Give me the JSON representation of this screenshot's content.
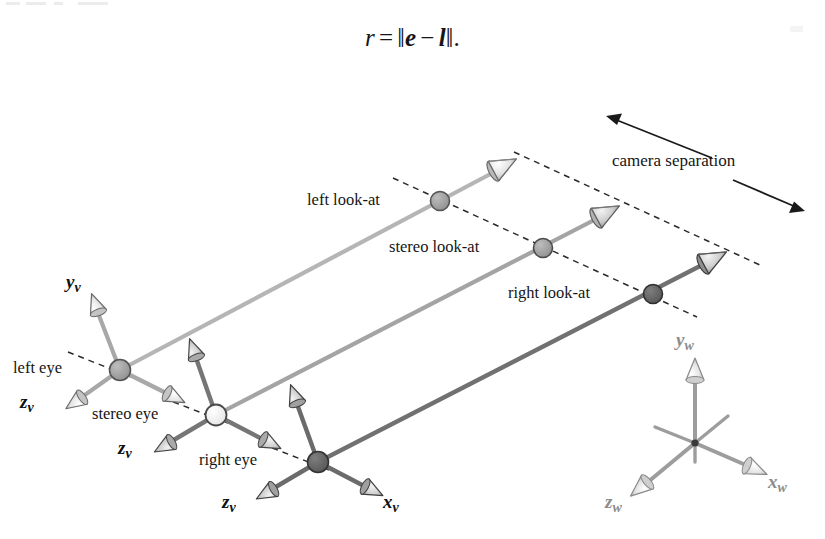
{
  "figure": {
    "equation": {
      "lhs": "r",
      "equals": "=",
      "norm_open": "‖",
      "vec_e": "e",
      "minus": "−",
      "vec_l": "l",
      "norm_close": "‖",
      "period": "."
    },
    "labels": {
      "left_eye": "left eye",
      "stereo_eye": "stereo eye",
      "right_eye": "right eye",
      "left_lookat": "left look-at",
      "stereo_lookat": "stereo look-at",
      "right_lookat": "right look-at",
      "camera_separation": "camera separation"
    },
    "axes": {
      "left_eye_y": {
        "name": "y",
        "sub": "v"
      },
      "left_eye_z": {
        "name": "z",
        "sub": "v"
      },
      "stereo_eye_z": {
        "name": "z",
        "sub": "v"
      },
      "right_eye_z": {
        "name": "z",
        "sub": "v"
      },
      "right_eye_x": {
        "name": "x",
        "sub": "v"
      },
      "world_y": {
        "name": "y",
        "sub": "w"
      },
      "world_x": {
        "name": "x",
        "sub": "w"
      },
      "world_z": {
        "name": "z",
        "sub": "w"
      }
    },
    "colors": {
      "left_ray": "#b3b3b3",
      "stereo_ray": "#9a9a9a",
      "right_ray": "#6e6e6e",
      "left_node": "#9b9b9b",
      "stereo_node": "#f2f2f2",
      "right_node": "#5f5f5f",
      "world_axis": "#9a9a9a",
      "dashed": "#2b2b2b",
      "text": "#151515"
    },
    "nodes": {
      "left_eye": {
        "x": 120,
        "y": 370
      },
      "stereo_eye": {
        "x": 216,
        "y": 415
      },
      "right_eye": {
        "x": 318,
        "y": 462
      },
      "left_lookat": {
        "x": 440,
        "y": 201
      },
      "stereo_lookat": {
        "x": 543,
        "y": 248
      },
      "right_lookat": {
        "x": 653,
        "y": 294
      },
      "world_origin": {
        "x": 695,
        "y": 443
      }
    }
  }
}
